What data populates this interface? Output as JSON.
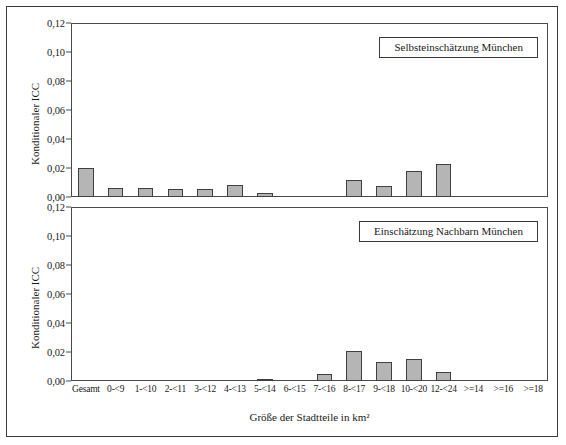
{
  "chart_data": {
    "type": "bar",
    "title": "",
    "xlabel": "Größe der Stadtteile in km²",
    "ylabel": "Konditionaler ICC",
    "ylim": [
      0,
      0.12
    ],
    "yticks": [
      "0,00",
      "0,02",
      "0,04",
      "0,06",
      "0,08",
      "0,10",
      "0,12"
    ],
    "ytick_values": [
      0.0,
      0.02,
      0.04,
      0.06,
      0.08,
      0.1,
      0.12
    ],
    "grid": false,
    "legend_position": "inside-top-right",
    "categories": [
      "Gesamt",
      "0-<9",
      "1-<10",
      "2-<11",
      "3-<12",
      "4-<13",
      "5-<14",
      "6-<15",
      "7-<16",
      "8-<17",
      "9-<18",
      "10-<20",
      "12-<24",
      ">=14",
      ">=16",
      ">=18"
    ],
    "panels": [
      {
        "name": "selbsteinschaetzung-muenchen",
        "label": "Selbsteinschätzung München",
        "values": [
          0.02,
          0.006,
          0.006,
          0.0055,
          0.0055,
          0.008,
          0.003,
          0.0,
          0.0,
          0.012,
          0.0075,
          0.018,
          0.023,
          0.0,
          0.0,
          0.0
        ]
      },
      {
        "name": "einschaetzung-nachbarn-muenchen",
        "label": "Einschätzung Nachbarn München",
        "values": [
          0.0,
          0.0,
          0.0,
          0.0,
          0.0,
          0.0,
          0.0008,
          0.0,
          0.005,
          0.021,
          0.013,
          0.015,
          0.0065,
          0.0,
          0.0,
          0.0
        ]
      }
    ],
    "colors": {
      "bar_fill": "#b5b5b5",
      "bar_stroke": "#3f3f3f",
      "axis": "#4a4a4a",
      "text": "#1a1a1a",
      "background": "#ffffff"
    }
  }
}
